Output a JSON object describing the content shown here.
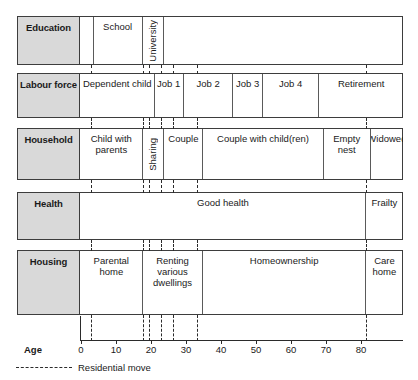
{
  "clipped_header_text": "",
  "axis": {
    "title": "Age",
    "unit_label": "Age",
    "min": 0,
    "max": 92,
    "ticks": [
      0,
      10,
      20,
      30,
      40,
      50,
      60,
      70,
      80
    ],
    "tick_labels": [
      "0",
      "10",
      "20",
      "30",
      "40",
      "50",
      "60",
      "70",
      "80"
    ]
  },
  "legend": {
    "label": "Residential move",
    "line_style": "dashed",
    "color": "#2b2b2b"
  },
  "residential_moves": [
    2.8,
    17.6,
    19.5,
    22.8,
    26.2,
    33.1,
    81.4
  ],
  "colors": {
    "label_fill": "#d9d9d9",
    "border": "#3d3d3d",
    "segment_divider": "#5a5a5a",
    "text": "#1a1a1a"
  },
  "chart_data": {
    "type": "table",
    "xlabel": "Age",
    "ylabel": "",
    "xlim": [
      0,
      92
    ],
    "grid": false,
    "legend_position": "bottom-left",
    "annotations": [
      "Residential move"
    ],
    "rows": [
      {
        "name": "Education",
        "segments": [
          {
            "label": "",
            "start": 0,
            "end": 3.6,
            "orientation": "horizontal"
          },
          {
            "label": "School",
            "start": 3.6,
            "end": 17.6,
            "orientation": "horizontal"
          },
          {
            "label": "University",
            "start": 17.6,
            "end": 23.8,
            "orientation": "vertical"
          },
          {
            "label": "",
            "start": 23.8,
            "end": 92,
            "orientation": "horizontal"
          }
        ]
      },
      {
        "name": "Labour force",
        "segments": [
          {
            "label": "Dependent child",
            "start": 0,
            "end": 21.0,
            "orientation": "horizontal"
          },
          {
            "label": "Job 1",
            "start": 21.0,
            "end": 29.4,
            "orientation": "horizontal"
          },
          {
            "label": "Job 2",
            "start": 29.4,
            "end": 43.5,
            "orientation": "horizontal"
          },
          {
            "label": "Job 3",
            "start": 43.5,
            "end": 52.0,
            "orientation": "horizontal"
          },
          {
            "label": "Job 4",
            "start": 52.0,
            "end": 68.1,
            "orientation": "horizontal"
          },
          {
            "label": "Retirement",
            "start": 68.1,
            "end": 92,
            "orientation": "horizontal"
          }
        ]
      },
      {
        "name": "Household",
        "segments": [
          {
            "label": "Child with parents",
            "start": 0,
            "end": 17.6,
            "orientation": "horizontal"
          },
          {
            "label": "Sharing",
            "start": 17.6,
            "end": 23.8,
            "orientation": "vertical"
          },
          {
            "label": "Couple",
            "start": 23.8,
            "end": 35.0,
            "orientation": "horizontal"
          },
          {
            "label": "Couple with child(ren)",
            "start": 35.0,
            "end": 69.3,
            "orientation": "horizontal"
          },
          {
            "label": "Empty nest",
            "start": 69.3,
            "end": 82.8,
            "orientation": "horizontal"
          },
          {
            "label": "Widowed",
            "start": 82.8,
            "end": 92,
            "orientation": "horizontal"
          }
        ]
      },
      {
        "name": "Health",
        "segments": [
          {
            "label": "Good health",
            "start": 0,
            "end": 81.4,
            "orientation": "horizontal"
          },
          {
            "label": "Frailty",
            "start": 81.4,
            "end": 92,
            "orientation": "horizontal"
          }
        ]
      },
      {
        "name": "Housing",
        "segments": [
          {
            "label": "Parental home",
            "start": 0,
            "end": 17.6,
            "orientation": "horizontal"
          },
          {
            "label": "Renting various dwellings",
            "start": 17.6,
            "end": 35.0,
            "orientation": "horizontal"
          },
          {
            "label": "Homeownership",
            "start": 35.0,
            "end": 81.4,
            "orientation": "horizontal"
          },
          {
            "label": "Care home",
            "start": 81.4,
            "end": 92,
            "orientation": "horizontal"
          }
        ]
      }
    ]
  }
}
